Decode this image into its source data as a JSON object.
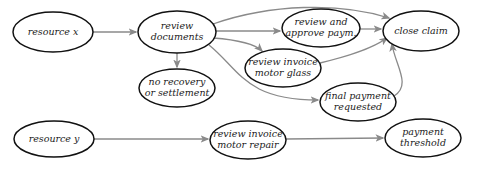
{
  "diagram": {
    "colors": {
      "background": "#ffffff",
      "node_border": "#111111",
      "node_fill": "#ffffff",
      "edge": "#8a8a8a",
      "text": "#222222"
    },
    "nodes": [
      {
        "id": "resource-x",
        "lines": [
          "resource x"
        ],
        "cx": 53,
        "cy": 32,
        "rx": 40,
        "ry": 20
      },
      {
        "id": "review-documents",
        "lines": [
          "review",
          "documents"
        ],
        "cx": 177,
        "cy": 32,
        "rx": 39,
        "ry": 21
      },
      {
        "id": "review-approve-paym",
        "lines": [
          "review and",
          "approve paym."
        ],
        "cx": 321,
        "cy": 28,
        "rx": 39,
        "ry": 19
      },
      {
        "id": "close-claim",
        "lines": [
          "close claim"
        ],
        "cx": 421,
        "cy": 31,
        "rx": 38,
        "ry": 20
      },
      {
        "id": "review-invoice-motor-glass",
        "lines": [
          "review invoice",
          "motor glass"
        ],
        "cx": 283,
        "cy": 68,
        "rx": 38,
        "ry": 19
      },
      {
        "id": "no-recovery",
        "lines": [
          "no recovery",
          "or settlement"
        ],
        "cx": 177,
        "cy": 88,
        "rx": 38,
        "ry": 19
      },
      {
        "id": "final-payment-requested",
        "lines": [
          "final payment",
          "requested"
        ],
        "cx": 358,
        "cy": 102,
        "rx": 38,
        "ry": 19
      },
      {
        "id": "resource-y",
        "lines": [
          "resource y"
        ],
        "cx": 54,
        "cy": 139,
        "rx": 40,
        "ry": 18
      },
      {
        "id": "review-invoice-motor-repair",
        "lines": [
          "review invoice",
          "motor repair"
        ],
        "cx": 248,
        "cy": 140,
        "rx": 38,
        "ry": 19
      },
      {
        "id": "payment-threshold",
        "lines": [
          "payment",
          "threshold"
        ],
        "cx": 423,
        "cy": 138,
        "rx": 38,
        "ry": 19
      }
    ],
    "edges": [
      {
        "from": "resource-x",
        "to": "review-documents",
        "path": "M 93 32 L 136 32"
      },
      {
        "from": "review-documents",
        "to": "close-claim",
        "path": "M 213 24 C 270 4, 340 2, 389 18"
      },
      {
        "from": "review-documents",
        "to": "review-approve-paym",
        "path": "M 216 31 L 280 31"
      },
      {
        "from": "review-documents",
        "to": "review-invoice-motor-glass",
        "path": "M 213 38 C 240 40, 255 44, 262 51"
      },
      {
        "from": "review-documents",
        "to": "no-recovery",
        "path": "M 177 53 L 177 67"
      },
      {
        "from": "review-documents",
        "to": "final-payment-requested",
        "path": "M 209 45 C 240 70, 245 100, 318 100"
      },
      {
        "from": "review-approve-paym",
        "to": "close-claim",
        "path": "M 360 29 L 381 29"
      },
      {
        "from": "review-invoice-motor-glass",
        "to": "close-claim",
        "path": "M 320 63 C 345 57, 370 50, 387 38"
      },
      {
        "from": "final-payment-requested",
        "to": "close-claim",
        "path": "M 394 96 C 412 85, 395 65, 392 44"
      },
      {
        "from": "resource-y",
        "to": "review-invoice-motor-repair",
        "path": "M 94 139 L 208 139"
      },
      {
        "from": "review-invoice-motor-repair",
        "to": "payment-threshold",
        "path": "M 286 139 L 383 138"
      }
    ]
  }
}
